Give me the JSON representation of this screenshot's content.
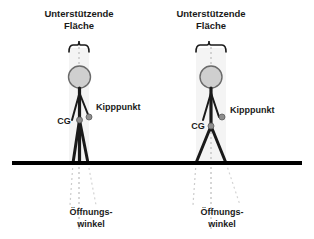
{
  "diagram": {
    "title_left": "Unterstützende Fläche",
    "title_right": "Unterstützende Fläche",
    "titles": [
      {
        "line1": "Unterstützende",
        "line2": "Fläche"
      },
      {
        "line1": "Unterstützende",
        "line2": "Fläche"
      }
    ],
    "colors": {
      "stroke": "#1a1a1a",
      "ground": "#000000",
      "head_fill": "#cccccc",
      "head_stroke": "#666666",
      "dot_fill": "#888888",
      "support_band": "#f2f2f2",
      "dotted_guide": "#bbbbbb",
      "text": "#1a1a1a"
    },
    "figures": [
      {
        "id": "narrow-stance",
        "stance": "narrow",
        "labels": {
          "support_area_line1": "Unterstützende",
          "support_area_line2": "Fläche",
          "tipping_point": "Kipppunkt",
          "center_of_gravity": "CG",
          "opening_angle_line1": "Öffnungs-",
          "opening_angle_line2": "winkel"
        }
      },
      {
        "id": "wide-stance",
        "stance": "wide",
        "labels": {
          "support_area_line1": "Unterstützende",
          "support_area_line2": "Fläche",
          "tipping_point": "Kipppunkt",
          "center_of_gravity": "CG",
          "opening_angle_line1": "Öffnungs-",
          "opening_angle_line2": "winkel"
        }
      }
    ],
    "shared_labels": {
      "tipping_point": "Kipppunkt",
      "center_of_gravity": "CG",
      "opening_angle_line1": "Öffnungs-",
      "opening_angle_line2": "winkel",
      "support_area_line1": "Unterstützende",
      "support_area_line2": "Fläche"
    },
    "icons": {
      "head": "head-circle-icon",
      "tipping_dot": "tipping-point-dot-icon",
      "cg_dot": "center-of-gravity-dot-icon",
      "brace": "curly-brace-icon",
      "ground": "ground-line-icon"
    }
  }
}
